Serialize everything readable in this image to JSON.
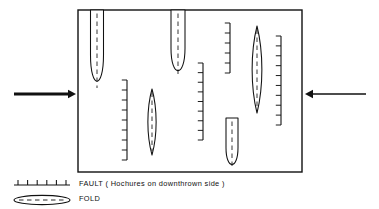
{
  "diagram": {
    "type": "structural-geology-map",
    "map_box": {
      "x": 78,
      "y": 10,
      "width": 224,
      "height": 162,
      "stroke": "#111111",
      "fill": "#ffffff",
      "stroke_width": 1.4
    },
    "stress_arrows": [
      {
        "name": "left-compression-arrow",
        "direction": "right",
        "x1": 14,
        "y1": 94,
        "x2": 76,
        "y2": 94,
        "thickness": 3.2
      },
      {
        "name": "right-compression-arrow",
        "direction": "left",
        "x1": 366,
        "y1": 94,
        "x2": 305,
        "y2": 94,
        "thickness": 1.6
      }
    ],
    "folds": [
      {
        "id": "fold-1",
        "cx": 97,
        "top": 10,
        "bottom": 92,
        "halfwidth": 6.5,
        "taper": "blunt-bottom",
        "open_top": true
      },
      {
        "id": "fold-2",
        "cx": 178,
        "top": 10,
        "bottom": 80,
        "halfwidth": 7.0,
        "taper": "blunt-bottom",
        "open_top": true
      },
      {
        "id": "fold-3",
        "cx": 152,
        "top": 89,
        "bottom": 155,
        "halfwidth": 5.5,
        "taper": "both-ends",
        "open_top": false
      },
      {
        "id": "fold-4",
        "cx": 257,
        "top": 26,
        "bottom": 113,
        "halfwidth": 6.5,
        "taper": "both-ends",
        "open_top": false
      },
      {
        "id": "fold-5",
        "cx": 232,
        "top": 118,
        "bottom": 172,
        "halfwidth": 6.0,
        "taper": "blunt-bottom",
        "open_top": false
      }
    ],
    "faults": [
      {
        "id": "fault-1",
        "x": 127,
        "top": 80,
        "bottom": 160,
        "hachure_side": "left",
        "ticks": 9
      },
      {
        "id": "fault-2",
        "x": 203,
        "top": 63,
        "bottom": 140,
        "hachure_side": "left",
        "ticks": 9
      },
      {
        "id": "fault-3",
        "x": 230,
        "top": 23,
        "bottom": 73,
        "hachure_side": "left",
        "ticks": 6
      },
      {
        "id": "fault-4",
        "x": 281,
        "top": 36,
        "bottom": 125,
        "hachure_side": "left",
        "ticks": 10
      }
    ]
  },
  "legend": {
    "fault": {
      "label": "FAULT ( Hochures on downthrown side )",
      "symbol": {
        "name": "fault-symbol",
        "x1": 14,
        "x2": 70,
        "y": 185,
        "ticks": 6,
        "tick_dir": "up"
      }
    },
    "fold": {
      "label": "FOLD",
      "symbol": {
        "name": "fold-symbol",
        "cx": 42,
        "cy": 200,
        "rx": 28,
        "ry": 4.6,
        "dashed_axis": true
      }
    }
  },
  "colors": {
    "ink": "#111111",
    "paper": "#ffffff"
  }
}
